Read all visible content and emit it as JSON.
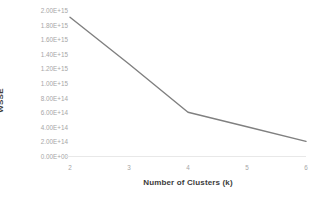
{
  "chart_data": {
    "type": "line",
    "title": "",
    "xlabel": "Number of Clusters (k)",
    "ylabel": "WSSE",
    "x": [
      2,
      3,
      4,
      5,
      6
    ],
    "categories": [
      "2",
      "3",
      "4",
      "5",
      "6"
    ],
    "values": [
      1900000000000000.0,
      1260000000000000.0,
      600000000000000.0,
      400000000000000.0,
      200000000000000.0
    ],
    "series": [
      {
        "name": "WSSE",
        "values": [
          1900000000000000.0,
          1260000000000000.0,
          600000000000000.0,
          400000000000000.0,
          200000000000000.0
        ]
      }
    ],
    "xlim": [
      2,
      6
    ],
    "ylim": [
      0,
      2000000000000000.0
    ],
    "ytick_values": [
      0,
      200000000000000.0,
      400000000000000.0,
      600000000000000.0,
      800000000000000.0,
      1000000000000000.0,
      1200000000000000.0,
      1400000000000000.0,
      1600000000000000.0,
      1800000000000000.0,
      2000000000000000.0
    ],
    "ytick_labels": [
      "0.00E+00",
      "2.00E+14",
      "4.00E+14",
      "6.00E+14",
      "8.00E+14",
      "1.00E+15",
      "1.20E+15",
      "1.40E+15",
      "1.60E+15",
      "1.80E+15",
      "2.00E+15"
    ],
    "xtick_labels": [
      "2",
      "3",
      "4",
      "5",
      "6"
    ],
    "grid": false,
    "legend": false,
    "legend_position": "none",
    "line_color": "#808080",
    "tick_label_color": "#a6a6a6",
    "axis_title_color": "#3b3b3b",
    "axis_line_color": "#e8e8e8",
    "background_color": "#ffffff",
    "line_width": 1.4,
    "markers": false
  }
}
